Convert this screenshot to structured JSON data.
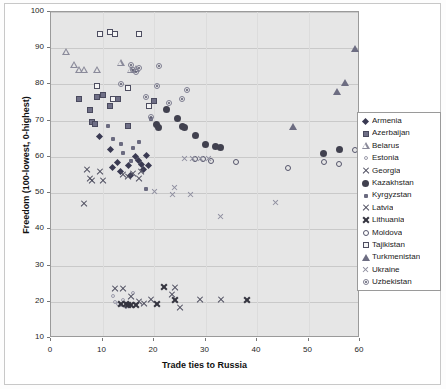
{
  "chart_data": {
    "type": "scatter",
    "title": "",
    "xlabel": "Trade ties to Russia",
    "ylabel": "Freedom (100-lowest, 0-highest)",
    "xlim": [
      0,
      60
    ],
    "ylim": [
      10,
      100
    ],
    "xticks": [
      0,
      10,
      20,
      30,
      40,
      50,
      60
    ],
    "yticks": [
      10,
      20,
      30,
      40,
      50,
      60,
      70,
      80,
      90,
      100
    ],
    "grid": true,
    "legend_position": "right",
    "series": [
      {
        "name": "Armenia",
        "marker": "filled-diamond",
        "color": "#3a3a52",
        "points": [
          [
            9.5,
            65.5
          ],
          [
            11.5,
            62.0
          ],
          [
            12.0,
            57.0
          ],
          [
            13.0,
            58.5
          ],
          [
            13.5,
            56.0
          ],
          [
            15.0,
            57.5
          ],
          [
            15.5,
            55.0
          ],
          [
            16.5,
            60.0
          ],
          [
            17.0,
            59.0
          ],
          [
            17.5,
            58.0
          ],
          [
            18.0,
            56.5
          ],
          [
            18.5,
            60.5
          ],
          [
            19.0,
            57.5
          ]
        ]
      },
      {
        "name": "Azerbaijan",
        "marker": "filled-square",
        "color": "#6f6f86",
        "points": [
          [
            5.5,
            76.0
          ],
          [
            7.5,
            73.0
          ],
          [
            8.0,
            69.5
          ],
          [
            8.5,
            69.0
          ],
          [
            9.0,
            76.5
          ],
          [
            10.0,
            77.0
          ],
          [
            11.5,
            74.0
          ],
          [
            13.0,
            76.0
          ],
          [
            15.0,
            68.5
          ],
          [
            19.0,
            74.0
          ],
          [
            20.0,
            75.5
          ]
        ]
      },
      {
        "name": "Belarus",
        "marker": "open-triangle",
        "color": "#8a8a9a",
        "points": [
          [
            3.0,
            89.0
          ],
          [
            4.5,
            85.5
          ],
          [
            5.5,
            84.0
          ],
          [
            6.5,
            84.0
          ],
          [
            9.0,
            84.0
          ],
          [
            13.5,
            86.0
          ],
          [
            15.5,
            84.0
          ],
          [
            16.5,
            84.5
          ]
        ]
      },
      {
        "name": "Estonia",
        "marker": "tiny-open-circle",
        "color": "#9b9bab",
        "points": [
          [
            12.0,
            21.5
          ],
          [
            12.5,
            20.0
          ],
          [
            13.0,
            19.5
          ],
          [
            13.5,
            19.0
          ],
          [
            14.0,
            20.5
          ],
          [
            14.5,
            18.5
          ],
          [
            15.0,
            19.0
          ],
          [
            16.0,
            22.5
          ]
        ]
      },
      {
        "name": "Georgia",
        "marker": "x",
        "color": "#4a4a5c",
        "points": [
          [
            7.0,
            56.5
          ],
          [
            7.5,
            54.0
          ],
          [
            8.0,
            53.5
          ],
          [
            9.5,
            56.0
          ],
          [
            10.0,
            53.5
          ],
          [
            14.0,
            55.0
          ],
          [
            15.0,
            54.5
          ],
          [
            16.0,
            55.5
          ],
          [
            17.0,
            54.0
          ],
          [
            17.5,
            56.0
          ],
          [
            6.5,
            47.0
          ]
        ]
      },
      {
        "name": "Kazakhstan",
        "marker": "filled-circle",
        "color": "#41414f",
        "points": [
          [
            22.5,
            73.0
          ],
          [
            24.5,
            70.5
          ],
          [
            25.5,
            68.5
          ],
          [
            26.0,
            68.0
          ],
          [
            28.0,
            66.0
          ],
          [
            20.5,
            69.0
          ],
          [
            20.8,
            68.0
          ],
          [
            30.0,
            63.5
          ],
          [
            32.0,
            63.0
          ],
          [
            33.0,
            62.5
          ],
          [
            53.0,
            61.0
          ],
          [
            56.0,
            62.0
          ]
        ]
      },
      {
        "name": "Kyrgyzstan",
        "marker": "bullet",
        "color": "#6b6b80",
        "points": [
          [
            11.0,
            68.5
          ],
          [
            12.0,
            65.0
          ],
          [
            13.5,
            63.5
          ],
          [
            14.0,
            61.0
          ],
          [
            16.0,
            62.5
          ],
          [
            18.5,
            51.0
          ],
          [
            15.5,
            59.0
          ],
          [
            17.0,
            64.0
          ],
          [
            19.5,
            70.5
          ]
        ]
      },
      {
        "name": "Latvia",
        "marker": "x",
        "color": "#4a4a5c",
        "points": [
          [
            12.5,
            23.5
          ],
          [
            14.0,
            23.5
          ],
          [
            15.5,
            21.5
          ],
          [
            17.0,
            20.0
          ],
          [
            18.0,
            19.5
          ],
          [
            19.5,
            20.5
          ],
          [
            23.5,
            22.0
          ],
          [
            24.0,
            24.0
          ],
          [
            25.0,
            18.5
          ],
          [
            29.0,
            20.5
          ],
          [
            33.0,
            20.5
          ]
        ]
      },
      {
        "name": "Lithuania",
        "marker": "x-bold",
        "color": "#34343f",
        "points": [
          [
            13.5,
            19.5
          ],
          [
            14.5,
            19.5
          ],
          [
            15.0,
            19.0
          ],
          [
            15.5,
            19.0
          ],
          [
            16.5,
            19.0
          ],
          [
            20.5,
            19.5
          ],
          [
            22.0,
            24.0
          ],
          [
            24.0,
            20.5
          ],
          [
            38.0,
            20.5
          ]
        ]
      },
      {
        "name": "Moldova",
        "marker": "open-circle",
        "color": "#55556b",
        "points": [
          [
            28.0,
            59.5
          ],
          [
            29.5,
            59.5
          ],
          [
            31.0,
            59.0
          ],
          [
            36.0,
            58.5
          ],
          [
            46.0,
            57.0
          ],
          [
            53.0,
            58.5
          ],
          [
            56.0,
            58.0
          ],
          [
            59.0,
            62.0
          ]
        ]
      },
      {
        "name": "Tajikistan",
        "marker": "open-square",
        "color": "#4d4d60",
        "points": [
          [
            9.5,
            94.0
          ],
          [
            11.5,
            94.5
          ],
          [
            12.5,
            94.0
          ],
          [
            17.0,
            94.0
          ],
          [
            9.0,
            79.5
          ],
          [
            12.0,
            76.0
          ],
          [
            15.0,
            79.0
          ],
          [
            19.0,
            74.0
          ]
        ]
      },
      {
        "name": "Turkmenistan",
        "marker": "filled-triangle",
        "color": "#6d6d82",
        "points": [
          [
            47.0,
            68.5
          ],
          [
            55.5,
            78.0
          ],
          [
            57.0,
            80.5
          ],
          [
            59.0,
            90.0
          ]
        ]
      },
      {
        "name": "Ukraine",
        "marker": "x-light",
        "color": "#8f8fa0",
        "points": [
          [
            26.0,
            59.5
          ],
          [
            27.5,
            59.5
          ],
          [
            29.0,
            59.5
          ],
          [
            30.5,
            59.5
          ],
          [
            20.0,
            50.5
          ],
          [
            23.5,
            49.5
          ],
          [
            27.0,
            49.5
          ],
          [
            33.0,
            43.5
          ],
          [
            43.5,
            47.5
          ],
          [
            24.0,
            51.5
          ]
        ]
      },
      {
        "name": "Uzbekistan",
        "marker": "dotted-circle",
        "color": "#7d7d90",
        "points": [
          [
            13.5,
            80.0
          ],
          [
            15.5,
            85.5
          ],
          [
            16.0,
            84.0
          ],
          [
            16.5,
            83.5
          ],
          [
            17.0,
            84.5
          ],
          [
            18.5,
            76.5
          ],
          [
            21.0,
            85.0
          ],
          [
            23.0,
            75.0
          ],
          [
            25.5,
            76.0
          ],
          [
            26.5,
            78.5
          ],
          [
            19.5,
            71.0
          ],
          [
            20.5,
            79.5
          ]
        ]
      }
    ]
  }
}
